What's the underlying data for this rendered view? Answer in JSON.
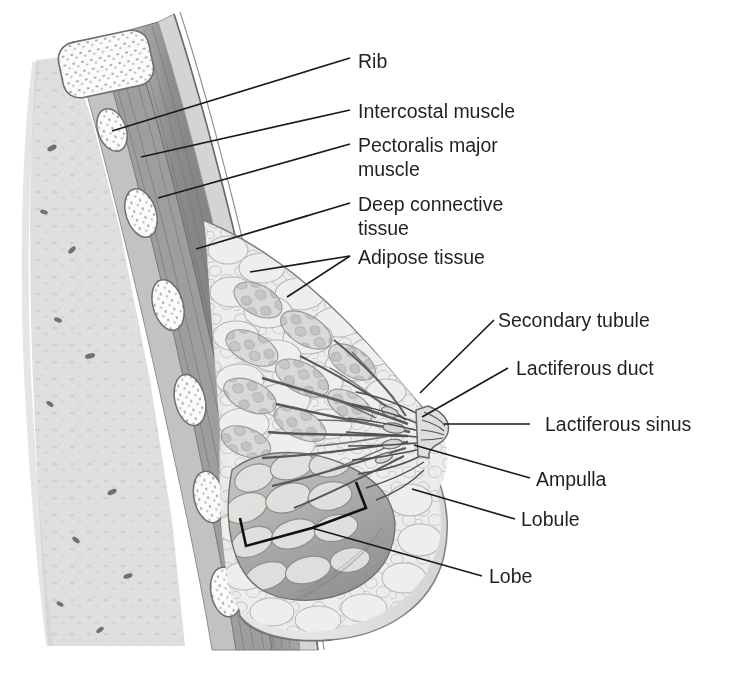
{
  "figure": {
    "background_color": "#ffffff",
    "ink_color": "#231f20",
    "leader_color": "#1a1a1a"
  },
  "labels": {
    "rib": "Rib",
    "intercostal_muscle": "Intercostal muscle",
    "pectoralis_major_line1": "Pectoralis major",
    "pectoralis_major_line2": "muscle",
    "deep_connective_line1": "Deep connective",
    "deep_connective_line2": "tissue",
    "adipose_tissue": "Adipose tissue",
    "secondary_tubule": "Secondary tubule",
    "lactiferous_duct": "Lactiferous duct",
    "lactiferous_sinus": "Lactiferous sinus",
    "ampulla": "Ampulla",
    "lobule": "Lobule",
    "lobe": "Lobe"
  },
  "structures": {
    "chest_wall": "chest wall with ribs and intercostal muscles",
    "pectoralis": "pectoralis major muscle band",
    "breast_tissue": "adipose and glandular breast tissue",
    "nipple": "nipple and areola",
    "duct_system": "lactiferous duct system converging at nipple",
    "lobes": "glandular lobes and lobules"
  },
  "palette": {
    "lung_tissue": "#d8d8d6",
    "rib_fill": "#fdfdfd",
    "rib_outline": "#7d7d7d",
    "intercostal": "#9a9a9a",
    "pectoralis": "#8a8a8a",
    "fascia": "#c6c6c6",
    "adipose": "#e9e9e7",
    "gland": "#b9b9b7",
    "duct": "#6b6b6b",
    "lobe_shade": "#9d9d9b"
  }
}
